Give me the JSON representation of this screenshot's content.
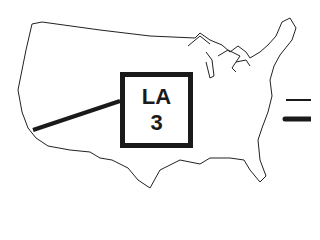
{
  "map": {
    "region": "United States (contiguous)",
    "marker": {
      "city": "LA",
      "value": "3"
    },
    "colors": {
      "outline": "#1a1a1a",
      "background": "#ffffff"
    },
    "legend": [
      {
        "style": "thin-line"
      },
      {
        "style": "thick-line"
      }
    ]
  }
}
